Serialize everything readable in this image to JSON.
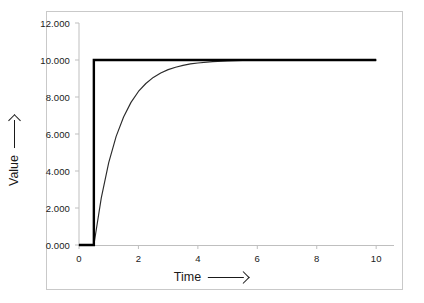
{
  "chart_data": {
    "type": "line",
    "title": "",
    "xlabel": "Time",
    "ylabel": "Value",
    "xlabel_arrow": "right-arrow",
    "ylabel_arrow": "up-arrow",
    "xlim": [
      0,
      10.6
    ],
    "ylim": [
      0,
      12
    ],
    "grid": false,
    "legend": "none",
    "x_ticks": [
      "0",
      "2",
      "4",
      "6",
      "8",
      "10"
    ],
    "x_tick_values": [
      0,
      2,
      4,
      6,
      8,
      10
    ],
    "y_ticks": [
      "0.000",
      "2.000",
      "4.000",
      "6.000",
      "8.000",
      "10.000",
      "12.000"
    ],
    "y_tick_values": [
      0,
      2,
      4,
      6,
      8,
      10,
      12
    ],
    "step_time": 0.5,
    "steady_state": 10.0,
    "series": [
      {
        "name": "step-input",
        "style": "thick-black-step",
        "color": "#000000",
        "width": 2.4,
        "x": [
          0,
          0.5,
          0.5,
          10
        ],
        "values": [
          0,
          0,
          10,
          10
        ]
      },
      {
        "name": "exponential-response",
        "style": "thin-black-curve",
        "color": "#2b2b2b",
        "width": 1.15,
        "x": [
          0,
          0.5,
          0.75,
          1.0,
          1.25,
          1.5,
          1.75,
          2.0,
          2.25,
          2.5,
          2.75,
          3.0,
          3.25,
          3.5,
          3.75,
          4.0,
          4.5,
          5.0,
          5.5,
          6.0,
          6.5,
          7.0,
          7.5,
          8.0,
          8.5,
          9.0,
          9.5,
          10.0
        ],
        "values": [
          0,
          0,
          2.55,
          4.45,
          5.87,
          6.92,
          7.71,
          8.3,
          8.73,
          9.06,
          9.3,
          9.48,
          9.61,
          9.71,
          9.79,
          9.84,
          9.91,
          9.95,
          9.97,
          9.98,
          9.99,
          9.995,
          9.997,
          9.998,
          9.999,
          9.999,
          10.0,
          10.0
        ]
      }
    ]
  },
  "axes": {
    "frame_color": "#c9c9c9",
    "axis_line_color": "#bfbfbf",
    "tick_color": "#bfbfbf",
    "text_color": "#1a1a1a",
    "background": "#ffffff"
  }
}
